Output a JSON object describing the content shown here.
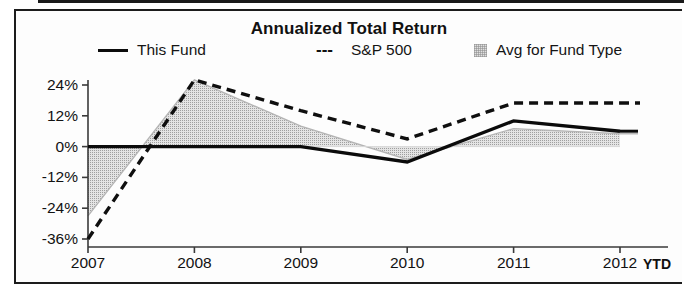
{
  "chart_data": {
    "type": "line",
    "title": "Annualized Total Return",
    "xlabel": "",
    "ylabel": "",
    "categories": [
      "2007",
      "2008",
      "2009",
      "2010",
      "2011",
      "2012"
    ],
    "x_axis_note": "YTD",
    "ylim": [
      -40,
      30
    ],
    "yticks": [
      24,
      12,
      0,
      -12,
      -24,
      -36
    ],
    "ytick_labels": [
      "24%",
      "12%",
      "0%",
      "-12%",
      "-24%",
      "-36%"
    ],
    "grid": false,
    "legend_position": "top",
    "series": [
      {
        "name": "This Fund",
        "style": "solid-line",
        "color": "#0c0c0c",
        "values": [
          0,
          0,
          0,
          -6,
          10,
          6
        ]
      },
      {
        "name": "S&P 500",
        "style": "dashed-line",
        "color": "#111111",
        "values": [
          -36,
          26,
          14,
          3,
          17,
          17
        ]
      },
      {
        "name": "Avg for Fund Type",
        "style": "shaded-area",
        "color": "#dcdcdc",
        "values": [
          -27,
          26,
          8,
          -5,
          7,
          5
        ]
      }
    ]
  },
  "chart": {
    "title": "Annualized Total Return",
    "legend": [
      {
        "label": "This Fund",
        "marker": "solid-line-swatch",
        "glyph": ""
      },
      {
        "label": "S&P 500",
        "marker": "dashed-line-swatch",
        "glyph": "---"
      },
      {
        "label": "Avg for Fund Type",
        "marker": "area-swatch",
        "glyph": ""
      }
    ],
    "axis": {
      "ytd_note": "YTD"
    }
  }
}
